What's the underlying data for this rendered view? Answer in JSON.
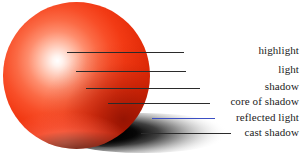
{
  "figure": {
    "background_color": "#ffffff",
    "width": 303,
    "height": 156
  },
  "sphere": {
    "name": "red-sphere",
    "base_color": "#f23a14",
    "highlight_color": "#ffffff",
    "core_shadow_color": "#7a0a00",
    "reflected_light_color": "#ff8269",
    "center_x": 76,
    "center_y": 75,
    "diameter": 147
  },
  "cast_shadow": {
    "name": "cast-shadow",
    "color": "#000000"
  },
  "annotations": [
    {
      "id": "highlight",
      "label": "highlight",
      "line_color": "#2b2b2b",
      "line_x": 67,
      "line_y": 52,
      "line_width": 117,
      "label_y": 45
    },
    {
      "id": "light",
      "label": "light",
      "line_color": "#2b2b2b",
      "line_x": 76,
      "line_y": 71,
      "line_width": 110,
      "label_y": 64
    },
    {
      "id": "shadow",
      "label": "shadow",
      "line_color": "#2b2b2b",
      "line_x": 86,
      "line_y": 88,
      "line_width": 114,
      "label_y": 81
    },
    {
      "id": "core-of-shadow",
      "label": "core of shadow",
      "line_color": "#2b2b2b",
      "line_x": 108,
      "line_y": 103,
      "line_width": 102,
      "label_y": 96
    },
    {
      "id": "reflected-light",
      "label": "reflected light",
      "line_color": "#3c4fc4",
      "line_x": 152,
      "line_y": 118,
      "line_width": 63,
      "label_y": 112
    },
    {
      "id": "cast-shadow",
      "label": "cast shadow",
      "line_color": "#2b2b2b",
      "line_x": 141,
      "line_y": 133,
      "line_width": 90,
      "label_y": 127
    }
  ]
}
